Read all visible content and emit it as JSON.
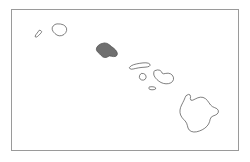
{
  "figure": {
    "width": 250,
    "height": 162,
    "background_color": "#ffffff"
  },
  "frame": {
    "name": "map-border",
    "stroke_color": "#9a9a9a",
    "fill_color": "#ffffff",
    "x": 11,
    "y": 9,
    "width": 228,
    "height": 142
  },
  "style": {
    "outline_stroke": "#4a4a4a",
    "outline_fill": "#ffffff",
    "highlight_fill": "#6f6f6f",
    "stroke_width": 0.7
  },
  "legend": {
    "highlight_meaning": "selected island",
    "highlighted_island": "Oahu"
  },
  "map_data": {
    "type": "choropleth-outline",
    "region": "Hawaii",
    "island_count": 8,
    "islands": [
      {
        "name": "Niihau",
        "highlighted": false,
        "label_x": 36,
        "label_y": 35,
        "path": "M 39.6 30.3 L 40.8 30.6 L 41.6 31.5 L 41.3 32.6 L 40.2 33.9 L 38.7 35.4 L 37.3 36.6 L 36.1 37.2 L 35.3 36.9 L 35.2 36.0 L 35.9 34.7 L 37.1 33.1 L 38.4 31.4 Z"
      },
      {
        "name": "Kauai",
        "highlighted": false,
        "label_x": 58,
        "label_y": 31,
        "path": "M 57.4 23.9 L 60.4 24.0 L 63.3 24.8 L 65.4 26.3 L 66.5 28.2 L 66.6 30.5 L 65.7 32.7 L 64.0 34.5 L 61.7 35.6 L 59.2 35.8 L 57.0 35.1 L 55.0 33.6 L 53.3 31.8 L 52.3 29.8 L 52.2 27.8 L 53.1 26.0 L 54.7 24.7 Z"
      },
      {
        "name": "Oahu",
        "highlighted": true,
        "label_x": 106,
        "label_y": 52,
        "path": "M 101.0 43.8 L 104.4 42.9 L 107.2 43.4 L 109.4 44.8 L 111.5 46.6 L 113.8 48.3 L 115.6 50.0 L 116.8 51.8 L 117.4 53.6 L 117.0 55.3 L 115.6 56.4 L 113.5 56.6 L 111.3 56.2 L 109.5 55.9 L 108.2 56.6 L 106.4 57.4 L 104.4 57.5 L 102.6 56.8 L 101.2 55.5 L 99.8 54.0 L 98.2 52.6 L 96.9 51.0 L 96.3 49.2 L 96.8 47.3 L 98.2 45.6 Z"
      },
      {
        "name": "Molokai",
        "highlighted": false,
        "label_x": 141,
        "label_y": 65,
        "path": "M 129.6 67.3 L 131.2 65.8 L 133.6 64.7 L 136.6 63.9 L 139.8 63.3 L 143.0 62.9 L 145.9 62.8 L 148.3 63.2 L 149.8 64.1 L 150.1 65.3 L 149.2 66.3 L 147.4 66.9 L 145.0 67.2 L 142.0 67.4 L 138.8 67.8 L 135.8 68.4 L 133.2 69.0 L 131.2 69.2 L 130.0 68.6 Z"
      },
      {
        "name": "Lanai",
        "highlighted": false,
        "label_x": 142,
        "label_y": 78,
        "path": "M 141.6 73.5 L 143.6 73.6 L 145.2 74.5 L 146.0 76.0 L 146.0 77.8 L 145.1 79.3 L 143.5 80.1 L 141.7 80.0 L 140.2 79.1 L 139.4 77.6 L 139.5 75.7 L 140.4 74.3 Z"
      },
      {
        "name": "Maui",
        "highlighted": false,
        "label_x": 160,
        "label_y": 77,
        "path": "M 155.0 70.6 L 157.6 69.9 L 159.9 70.3 L 161.4 71.6 L 162.2 73.2 L 163.6 73.8 L 165.8 73.4 L 168.2 73.2 L 170.5 73.8 L 172.3 75.2 L 173.4 77.2 L 173.5 79.4 L 172.6 81.4 L 170.9 82.8 L 168.6 83.6 L 166.0 83.8 L 163.4 83.4 L 161.0 82.5 L 158.9 81.2 L 157.0 79.6 L 155.4 77.8 L 154.2 75.9 L 153.7 74.0 L 153.9 72.1 Z"
      },
      {
        "name": "Kahoolawe",
        "highlighted": false,
        "label_x": 152,
        "label_y": 89,
        "path": "M 149.8 86.9 L 152.0 86.7 L 154.2 87.0 L 155.6 87.8 L 155.6 88.9 L 154.2 89.6 L 152.0 89.8 L 150.0 89.5 L 148.9 88.7 L 149.0 87.6 Z"
      },
      {
        "name": "Hawaii (Big Island)",
        "highlighted": false,
        "label_x": 196,
        "label_y": 120,
        "path": "M 186.4 95.5 L 188.4 94.4 L 190.0 94.9 L 190.6 96.6 L 190.3 98.6 L 190.9 100.2 L 192.8 100.2 L 195.2 99.0 L 197.8 97.8 L 200.4 97.2 L 203.0 97.4 L 205.4 98.6 L 207.4 100.5 L 209.0 102.8 L 210.6 105.0 L 212.4 106.6 L 214.6 107.6 L 216.8 108.6 L 218.2 110.2 L 218.4 112.2 L 217.2 114.0 L 215.2 115.2 L 213.0 116.0 L 211.2 117.2 L 210.2 119.2 L 209.6 121.6 L 208.6 124.0 L 207.0 126.2 L 204.8 128.2 L 202.2 129.8 L 199.4 131.0 L 196.6 131.8 L 193.8 132.0 L 191.2 131.4 L 189.2 130.0 L 188.0 128.0 L 187.4 125.6 L 186.6 123.2 L 185.2 121.0 L 183.4 119.2 L 181.8 117.2 L 180.6 115.0 L 180.0 112.6 L 180.0 110.0 L 180.6 107.4 L 181.6 105.0 L 182.8 102.6 L 184.0 100.2 L 185.0 97.8 Z"
      }
    ]
  }
}
